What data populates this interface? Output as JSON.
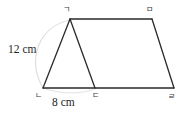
{
  "figure": {
    "type": "quadrilateral-with-diagonal",
    "background_color": "#ffffff",
    "line_color": "#2a2a2a",
    "arc_color": "#d9d9d9",
    "vertices": [
      {
        "id": "a",
        "label": "ㄱ",
        "x": 70,
        "y": 19,
        "position": "top-left-apex"
      },
      {
        "id": "b",
        "label": "ㅁ",
        "x": 152,
        "y": 19,
        "position": "top-right"
      },
      {
        "id": "c",
        "label": "ㄴ",
        "x": 43,
        "y": 88,
        "position": "bottom-left"
      },
      {
        "id": "d",
        "label": "ㄷ",
        "x": 95,
        "y": 88,
        "position": "bottom-middle"
      },
      {
        "id": "e",
        "label": "ㄹ",
        "x": 174,
        "y": 88,
        "position": "bottom-right"
      }
    ],
    "edges": [
      {
        "from": "a",
        "to": "b",
        "name": "top-edge"
      },
      {
        "from": "b",
        "to": "e",
        "name": "right-edge"
      },
      {
        "from": "e",
        "to": "d",
        "name": "bottom-right-edge"
      },
      {
        "from": "d",
        "to": "c",
        "name": "bottom-left-edge"
      },
      {
        "from": "c",
        "to": "a",
        "name": "left-slant-edge"
      },
      {
        "from": "a",
        "to": "d",
        "name": "interior-diagonal"
      }
    ],
    "measurements": [
      {
        "id": "left-side",
        "text": "12 cm",
        "value": 12,
        "unit": "cm",
        "applies_to": "edge ㄱ-ㄴ"
      },
      {
        "id": "bottom-side",
        "text": "8 cm",
        "value": 8,
        "unit": "cm",
        "applies_to": "edge ㄴ-ㄷ"
      }
    ],
    "arc": {
      "name": "faint-construction-arc",
      "from_vertex": "a",
      "to_vertex": "c",
      "style": "light gray elliptical arc bulging left"
    }
  }
}
